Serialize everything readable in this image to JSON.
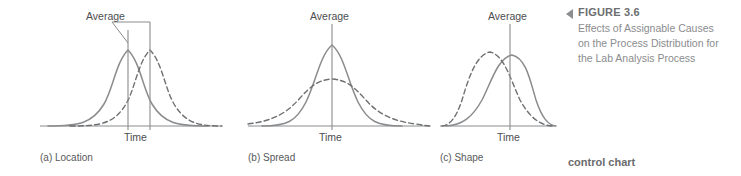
{
  "figure": {
    "panels": [
      {
        "id": "location",
        "panel_label": "(a) Location",
        "average_label": "Average",
        "axis_label": "Time",
        "curves": [
          {
            "style": "solid",
            "role": "original-distribution",
            "mean_shift": -11,
            "spread": 30,
            "peak_height": 78
          },
          {
            "style": "dashed",
            "role": "shifted-distribution",
            "mean_shift": 11,
            "spread": 30,
            "peak_height": 78
          }
        ],
        "vertical_lines": 2
      },
      {
        "id": "spread",
        "panel_label": "(b) Spread",
        "average_label": "Average",
        "axis_label": "Time",
        "curves": [
          {
            "style": "solid",
            "role": "original-distribution",
            "mean_shift": 0,
            "spread": 23,
            "peak_height": 88
          },
          {
            "style": "dashed",
            "role": "widened-distribution",
            "mean_shift": 0,
            "spread": 40,
            "peak_height": 50
          }
        ],
        "vertical_lines": 1
      },
      {
        "id": "shape",
        "panel_label": "(c) Shape",
        "average_label": "Average",
        "axis_label": "Time",
        "curves": [
          {
            "style": "solid",
            "role": "original-distribution",
            "skew": "right",
            "spread": 28,
            "peak_height": 76
          },
          {
            "style": "dashed",
            "role": "skewed-shape-distribution",
            "skew": "left",
            "spread": 28,
            "peak_height": 78
          }
        ],
        "vertical_lines": 1
      }
    ],
    "caption": {
      "marker": "left-triangle",
      "title": "FIGURE 3.6",
      "lines": [
        "Effects of Assignable Causes",
        "on the Process Distribution for",
        "the Lab Analysis Process"
      ]
    },
    "running_term": "control chart",
    "colors": {
      "curve": "#8a8b8d",
      "axis": "#8a8b8d",
      "text": "#58595b",
      "caption_title": "#6d6e70",
      "caption_body": "#8b8c8e",
      "marker": "#8c8d8f",
      "background": "#ffffff"
    }
  }
}
